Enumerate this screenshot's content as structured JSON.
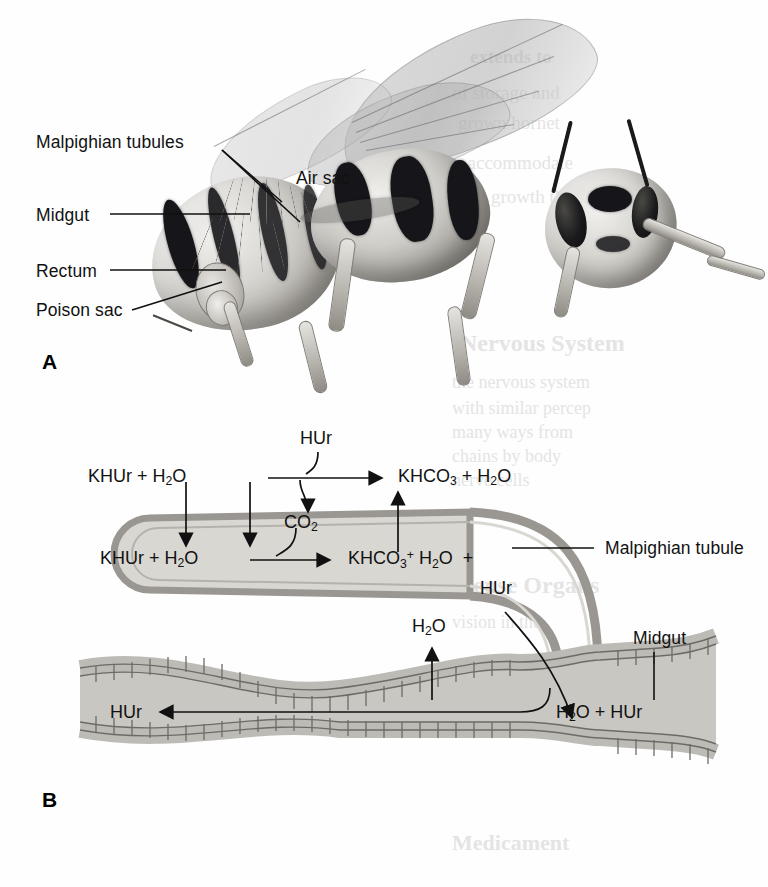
{
  "figure": {
    "panels": [
      {
        "letter": "A",
        "kind": "hornet-anatomy-illustration",
        "labels": [
          {
            "text": "Malpighian tubules",
            "x": 36,
            "y": 132
          },
          {
            "text": "Air sac",
            "x": 296,
            "y": 168
          },
          {
            "text": "Midgut",
            "x": 36,
            "y": 205
          },
          {
            "text": "Rectum",
            "x": 36,
            "y": 261
          },
          {
            "text": "Poison sac",
            "x": 36,
            "y": 300
          }
        ]
      },
      {
        "letter": "B",
        "kind": "malpighian-tubule-midgut-schematic",
        "labels": [
          {
            "text": "Malpighian tubule",
            "x": 605,
            "y": 548
          },
          {
            "text": "Midgut",
            "x": 633,
            "y": 639
          }
        ],
        "equations": {
          "upper_row": {
            "reactant": "KHUr + H₂O",
            "catalyst_above": "HUr",
            "byproduct_below": "CO₂",
            "product": "KHCO₃ + H₂O"
          },
          "tubule_row": {
            "reactant": "KHUr + H₂O",
            "product": "KHCO₃",
            "product_tail": "H₂O  +",
            "product_sup": "+",
            "secreted": "HUr"
          },
          "gut_row": {
            "water_out": "H₂O",
            "absorbed": "HUr",
            "lumen_contents": "H₂O + HUr"
          }
        }
      }
    ],
    "bleed_through_text": [
      {
        "text": "extends to",
        "x": 470,
        "y": 46,
        "size": 19,
        "bold": true
      },
      {
        "text": "of storage and",
        "x": 452,
        "y": 82,
        "size": 19,
        "bold": false
      },
      {
        "text": "grown hornet",
        "x": 458,
        "y": 112,
        "size": 19,
        "bold": false
      },
      {
        "text": "to accommodate",
        "x": 448,
        "y": 152,
        "size": 19,
        "bold": false
      },
      {
        "text": "much growth then",
        "x": 444,
        "y": 186,
        "size": 19,
        "bold": false
      },
      {
        "text": "Nervous System",
        "x": 460,
        "y": 330,
        "size": 24,
        "bold": true
      },
      {
        "text": "the nervous system",
        "x": 452,
        "y": 372,
        "size": 18,
        "bold": false
      },
      {
        "text": "with similar percep",
        "x": 452,
        "y": 398,
        "size": 18,
        "bold": false
      },
      {
        "text": "many ways from",
        "x": 452,
        "y": 422,
        "size": 18,
        "bold": false
      },
      {
        "text": "chains by body",
        "x": 452,
        "y": 446,
        "size": 18,
        "bold": false
      },
      {
        "text": "nerve cells",
        "x": 452,
        "y": 470,
        "size": 18,
        "bold": false
      },
      {
        "text": "Sense Organs",
        "x": 460,
        "y": 572,
        "size": 24,
        "bold": true
      },
      {
        "text": "vision in the",
        "x": 452,
        "y": 612,
        "size": 18,
        "bold": false
      },
      {
        "text": "Medicament",
        "x": 452,
        "y": 830,
        "size": 22,
        "bold": true
      }
    ],
    "colors": {
      "ink": "#111111",
      "tubule_wall": "#9a9792",
      "tubule_lumen": "#d9d7d2",
      "gut_lumen": "#c9c7c2",
      "gut_cell_fill": "#bdbbb6",
      "gut_cell_edge": "#6e6b66",
      "bleed": "#cfcfcf",
      "paper": "#fefefe"
    }
  }
}
